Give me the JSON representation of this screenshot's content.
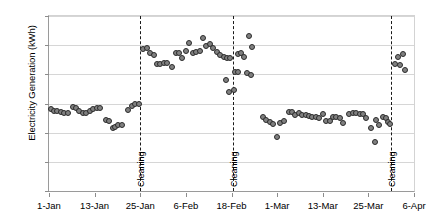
{
  "chart_data": {
    "type": "scatter",
    "title": "",
    "xlabel": "",
    "ylabel": "Electricity Generation (kWh)",
    "ylim": [
      0,
      60
    ],
    "ytick_values": [
      0,
      10,
      20,
      30,
      40,
      50,
      60
    ],
    "ytick_labels": [
      "0",
      "10",
      "20",
      "30",
      "40",
      "50",
      "60"
    ],
    "xlim": [
      0,
      96
    ],
    "xtick_positions": [
      0,
      12,
      24,
      36,
      48,
      60,
      72,
      84,
      96
    ],
    "xtick_labels": [
      "1-Jan",
      "13-Jan",
      "25-Jan",
      "6-Feb",
      "18-Feb",
      "1-Mar",
      "13-Mar",
      "25-Mar",
      "6-Apr"
    ],
    "grid": true,
    "grid_axis": "y",
    "legend": false,
    "marker": "circle",
    "marker_fill": "#808080",
    "marker_edge": "#2b2b2b",
    "annotations": [
      {
        "label": "Cleaning",
        "x": 24,
        "orientation": "vertical",
        "line": "dashed",
        "color": "#1a1a1a"
      },
      {
        "label": "Cleaning",
        "x": 48.5,
        "orientation": "vertical",
        "line": "dashed",
        "color": "#1a1a1a"
      },
      {
        "label": "Cleaning",
        "x": 90,
        "orientation": "vertical",
        "line": "dashed",
        "color": "#1a1a1a"
      }
    ],
    "series": [
      {
        "name": "Daily electricity generation",
        "points": [
          [
            0.4,
            28.2
          ],
          [
            1.3,
            27.6
          ],
          [
            2.2,
            27.3
          ],
          [
            3.1,
            27.1
          ],
          [
            4.0,
            26.6
          ],
          [
            5.0,
            26.6
          ],
          [
            6.2,
            28.8
          ],
          [
            7.1,
            28.5
          ],
          [
            8.0,
            27.5
          ],
          [
            8.9,
            26.6
          ],
          [
            9.8,
            26.9
          ],
          [
            10.8,
            27.5
          ],
          [
            11.7,
            28.1
          ],
          [
            12.6,
            28.4
          ],
          [
            13.5,
            28.5
          ],
          [
            15.0,
            24.4
          ],
          [
            15.9,
            24.0
          ],
          [
            16.8,
            21.5
          ],
          [
            17.3,
            21.9
          ],
          [
            18.2,
            22.8
          ],
          [
            19.1,
            22.6
          ],
          [
            20.9,
            27.7
          ],
          [
            21.8,
            29.3
          ],
          [
            22.7,
            29.8
          ],
          [
            23.6,
            29.9
          ],
          [
            24.8,
            48.6
          ],
          [
            25.7,
            48.9
          ],
          [
            26.6,
            47.2
          ],
          [
            27.5,
            46.5
          ],
          [
            28.4,
            43.7
          ],
          [
            29.3,
            43.6
          ],
          [
            30.2,
            44.0
          ],
          [
            31.1,
            43.8
          ],
          [
            32.4,
            42.6
          ],
          [
            33.3,
            47.4
          ],
          [
            34.2,
            47.4
          ],
          [
            35.1,
            45.6
          ],
          [
            36.0,
            48.0
          ],
          [
            36.9,
            50.9
          ],
          [
            37.8,
            47.3
          ],
          [
            38.7,
            47.5
          ],
          [
            39.6,
            48.0
          ],
          [
            40.5,
            52.5
          ],
          [
            41.4,
            49.6
          ],
          [
            42.3,
            50.3
          ],
          [
            43.2,
            49.2
          ],
          [
            44.1,
            47.5
          ],
          [
            45.0,
            46.8
          ],
          [
            45.9,
            46.0
          ],
          [
            46.8,
            45.7
          ],
          [
            47.6,
            45.5
          ],
          [
            46.5,
            38.1
          ],
          [
            47.4,
            34.1
          ],
          [
            48.9,
            40.7
          ],
          [
            49.8,
            40.9
          ],
          [
            48.7,
            34.8
          ],
          [
            49.6,
            47.1
          ],
          [
            50.5,
            47.2
          ],
          [
            51.4,
            46.1
          ],
          [
            52.5,
            53.3
          ],
          [
            53.4,
            49.4
          ],
          [
            52.0,
            40.3
          ],
          [
            53.0,
            39.8
          ],
          [
            56.3,
            25.3
          ],
          [
            57.2,
            24.4
          ],
          [
            58.1,
            23.7
          ],
          [
            59.0,
            23.1
          ],
          [
            59.9,
            18.4
          ],
          [
            60.8,
            23.4
          ],
          [
            61.7,
            23.9
          ],
          [
            63.0,
            27.0
          ],
          [
            63.9,
            27.0
          ],
          [
            64.8,
            26.1
          ],
          [
            65.7,
            26.9
          ],
          [
            66.6,
            26.2
          ],
          [
            67.5,
            25.9
          ],
          [
            68.4,
            25.8
          ],
          [
            69.3,
            25.5
          ],
          [
            70.2,
            25.3
          ],
          [
            71.1,
            25.2
          ],
          [
            72.0,
            26.5
          ],
          [
            72.9,
            24.0
          ],
          [
            73.8,
            23.9
          ],
          [
            74.7,
            25.4
          ],
          [
            75.6,
            25.3
          ],
          [
            76.5,
            24.9
          ],
          [
            77.4,
            23.4
          ],
          [
            79.0,
            26.5
          ],
          [
            79.9,
            26.6
          ],
          [
            80.8,
            26.6
          ],
          [
            81.7,
            26.5
          ],
          [
            82.6,
            26.4
          ],
          [
            83.5,
            25.2
          ],
          [
            84.6,
            21.6
          ],
          [
            85.8,
            16.7
          ],
          [
            86.0,
            24.4
          ],
          [
            86.9,
            22.7
          ],
          [
            87.8,
            25.3
          ],
          [
            88.7,
            24.9
          ],
          [
            89.2,
            23.6
          ],
          [
            89.8,
            22.9
          ],
          [
            91.0,
            43.5
          ],
          [
            91.9,
            45.9
          ],
          [
            92.2,
            43.2
          ],
          [
            93.0,
            47.0
          ],
          [
            93.6,
            41.4
          ]
        ]
      }
    ]
  }
}
